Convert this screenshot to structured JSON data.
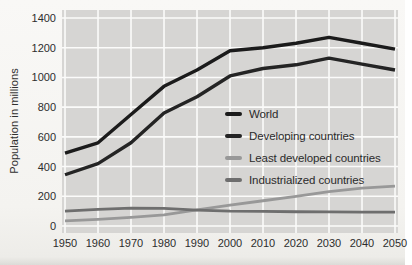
{
  "figure": {
    "ylabel": "Population in millions"
  },
  "chart_data": {
    "type": "line",
    "title": "",
    "xlabel": "",
    "ylabel": "Population in millions",
    "x": [
      1950,
      1960,
      1970,
      1980,
      1990,
      2000,
      2010,
      2020,
      2030,
      2040,
      2050
    ],
    "series": [
      {
        "name": "World",
        "color": "#1b1b1b",
        "width": 3.4,
        "values": [
          490,
          560,
          750,
          940,
          1050,
          1180,
          1200,
          1230,
          1270,
          1230,
          1190
        ]
      },
      {
        "name": "Developing countries",
        "color": "#242424",
        "width": 3.4,
        "values": [
          345,
          420,
          560,
          760,
          870,
          1010,
          1060,
          1085,
          1130,
          1090,
          1050
        ]
      },
      {
        "name": "Least developed countries",
        "color": "#989898",
        "width": 2.8,
        "values": [
          35,
          45,
          58,
          75,
          108,
          140,
          170,
          200,
          232,
          255,
          268
        ]
      },
      {
        "name": "Industrialized countries",
        "color": "#6e6e6e",
        "width": 2.8,
        "values": [
          100,
          112,
          120,
          118,
          107,
          100,
          98,
          96,
          95,
          94,
          94
        ]
      }
    ],
    "ylim": [
      0,
      1400
    ],
    "y_ticks": [
      0,
      200,
      400,
      600,
      800,
      1000,
      1200,
      1400
    ],
    "x_ticks": [
      "1950",
      "1960",
      "1970",
      "1980",
      "1990",
      "2000",
      "2010",
      "2020",
      "2030",
      "2040",
      "2050"
    ],
    "grid": true,
    "grid_color": "#fbfbfa",
    "plot_bg": "#d6d5d3",
    "legend_position": "inside-right"
  }
}
